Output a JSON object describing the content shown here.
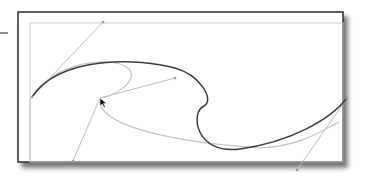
{
  "diagram": {
    "type": "bezier-curve-editing",
    "colors": {
      "background": "#ffffff",
      "frame_border": "#3a3a3a",
      "inner_guide": "#cfcfcf",
      "main_curve": "#3c3c3c",
      "ghost_curve": "#c4c4c4",
      "handle_line": "#bdbdbd",
      "handle_point": "#9a9a9a",
      "cursor": "#111111",
      "shadow": "#7a7a7a"
    },
    "frame": {
      "x": 18,
      "y": 12,
      "width": 325,
      "height": 150
    },
    "inner_guide": {
      "x": 30,
      "y": 23,
      "width": 313,
      "height": 139
    },
    "left_dash": {
      "x1": 0,
      "y1": 33,
      "x2": 8,
      "y2": 33
    },
    "main_curve_path": "M 32 97 C 60 55, 140 58, 175 68 C 200 75, 215 100, 204 106 C 190 112, 195 155, 240 149 C 290 142, 330 120, 347 98",
    "ghost_curve_path": "M 32 97 C 55 60, 115 55, 129 69 C 140 82, 110 98, 100 98 C 95 125, 170 142, 260 148 C 300 146, 320 132, 339 122",
    "handles": [
      {
        "x1": 32,
        "y1": 97,
        "x2": 103,
        "y2": 22
      },
      {
        "x1": 100,
        "y1": 98,
        "x2": 175,
        "y2": 78
      },
      {
        "x1": 100,
        "y1": 98,
        "x2": 73,
        "y2": 161
      },
      {
        "x1": 347,
        "y1": 98,
        "x2": 297,
        "y2": 170
      },
      {
        "x1": 30,
        "y1": 98,
        "x2": 30,
        "y2": 162
      }
    ],
    "handle_points": [
      {
        "x": 103,
        "y": 22
      },
      {
        "x": 175,
        "y": 78
      },
      {
        "x": 73,
        "y": 161
      },
      {
        "x": 297,
        "y": 170
      },
      {
        "x": 347,
        "y": 98
      },
      {
        "x": 32,
        "y": 97
      }
    ],
    "cursor": {
      "x": 100,
      "y": 98
    }
  }
}
